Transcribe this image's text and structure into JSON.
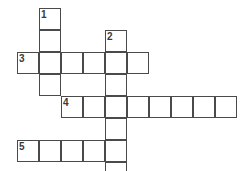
{
  "puzzle": {
    "type": "crossword-grid",
    "title": "",
    "background_color": "#ffffff",
    "cell_border_color": "#4a4a4a",
    "cell_fill_color": "#ffffff",
    "number_color": "#3a3a3a",
    "cell_size": 22,
    "origin_x": 17,
    "origin_y": 8,
    "grid_columns": 10,
    "grid_rows": 8,
    "entries": [
      {
        "number": "1",
        "direction": "down",
        "row": 0,
        "col": 1,
        "length": 4
      },
      {
        "number": "2",
        "direction": "down",
        "row": 1,
        "col": 4,
        "length": 7
      },
      {
        "number": "3",
        "direction": "across",
        "row": 2,
        "col": 0,
        "length": 6
      },
      {
        "number": "4",
        "direction": "across",
        "row": 4,
        "col": 2,
        "length": 8
      },
      {
        "number": "5",
        "direction": "across",
        "row": 6,
        "col": 0,
        "length": 5
      }
    ],
    "cells": [
      {
        "row": 0,
        "col": 1,
        "number": "1"
      },
      {
        "row": 1,
        "col": 1,
        "number": ""
      },
      {
        "row": 1,
        "col": 4,
        "number": "2"
      },
      {
        "row": 2,
        "col": 0,
        "number": "3"
      },
      {
        "row": 2,
        "col": 1,
        "number": ""
      },
      {
        "row": 2,
        "col": 2,
        "number": ""
      },
      {
        "row": 2,
        "col": 3,
        "number": ""
      },
      {
        "row": 2,
        "col": 4,
        "number": ""
      },
      {
        "row": 2,
        "col": 5,
        "number": ""
      },
      {
        "row": 3,
        "col": 1,
        "number": ""
      },
      {
        "row": 3,
        "col": 4,
        "number": ""
      },
      {
        "row": 4,
        "col": 2,
        "number": "4"
      },
      {
        "row": 4,
        "col": 3,
        "number": ""
      },
      {
        "row": 4,
        "col": 4,
        "number": ""
      },
      {
        "row": 4,
        "col": 5,
        "number": ""
      },
      {
        "row": 4,
        "col": 6,
        "number": ""
      },
      {
        "row": 4,
        "col": 7,
        "number": ""
      },
      {
        "row": 4,
        "col": 8,
        "number": ""
      },
      {
        "row": 4,
        "col": 9,
        "number": ""
      },
      {
        "row": 5,
        "col": 4,
        "number": ""
      },
      {
        "row": 6,
        "col": 0,
        "number": "5"
      },
      {
        "row": 6,
        "col": 1,
        "number": ""
      },
      {
        "row": 6,
        "col": 2,
        "number": ""
      },
      {
        "row": 6,
        "col": 3,
        "number": ""
      },
      {
        "row": 6,
        "col": 4,
        "number": ""
      },
      {
        "row": 7,
        "col": 4,
        "number": ""
      }
    ]
  }
}
